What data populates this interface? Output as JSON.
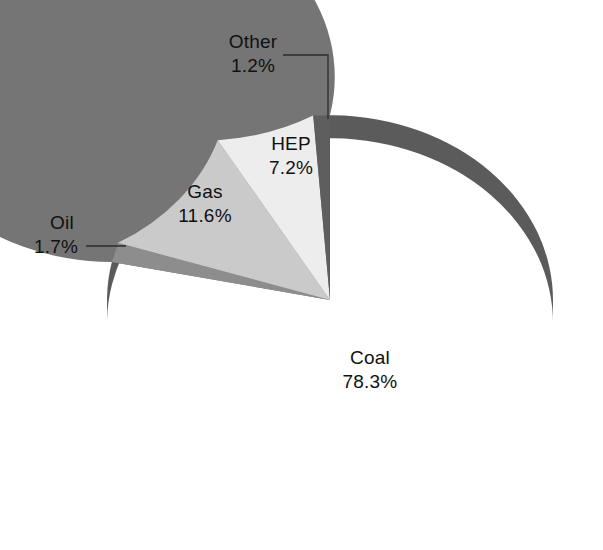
{
  "chart_data": {
    "type": "pie",
    "title": "",
    "subtitle": "",
    "xlabel": "",
    "ylabel": "",
    "legend_position": "none",
    "grid": false,
    "three_d": true,
    "start_angle_deg": -90,
    "direction": "counterclockwise",
    "categories": [
      "Coal",
      "Oil",
      "Gas",
      "HEP",
      "Other"
    ],
    "values": [
      78.3,
      1.7,
      11.6,
      7.2,
      1.2
    ],
    "unit": "%",
    "slices": [
      {
        "name": "Coal",
        "label": "Coal",
        "value": 78.3,
        "value_text": "78.3%",
        "color": "#757575",
        "side_color": "#5b5b5b",
        "label_x": 370,
        "label_y": 364,
        "leader": false
      },
      {
        "name": "Oil",
        "label": "Oil",
        "value": 1.7,
        "value_text": "1.7%",
        "color": "#8d8d8d",
        "side_color": "#6e6e6e",
        "label_x": 62,
        "label_y": 229,
        "leader": true
      },
      {
        "name": "Gas",
        "label": "Gas",
        "value": 11.6,
        "value_text": "11.6%",
        "color": "#cacaca",
        "side_color": "#a5a5a5",
        "label_x": 205,
        "label_y": 198,
        "leader": false
      },
      {
        "name": "HEP",
        "label": "HEP",
        "value": 7.2,
        "value_text": "7.2%",
        "color": "#ededed",
        "side_color": "#c2c2c2",
        "label_x": 291,
        "label_y": 150,
        "leader": false
      },
      {
        "name": "Other",
        "label": "Other",
        "value": 1.2,
        "value_text": "1.2%",
        "color": "#5e5e5e",
        "side_color": "#4a4a4a",
        "label_x": 253,
        "label_y": 48,
        "leader": true
      }
    ],
    "colors": {
      "coal": "#757575",
      "oil": "#8d8d8d",
      "gas": "#cacaca",
      "hep": "#ededed",
      "other": "#5e5e5e",
      "background": "#ffffff",
      "text": "#111111",
      "leader": "#2b2b2b"
    },
    "geometry": {
      "center_x": 330,
      "center_y": 300,
      "radius_x": 223,
      "radius_y": 185,
      "depth": 23
    }
  },
  "labels": {
    "coal_name": "Coal",
    "coal_pct": "78.3%",
    "oil_name": "Oil",
    "oil_pct": "1.7%",
    "gas_name": "Gas",
    "gas_pct": "11.6%",
    "hep_name": "HEP",
    "hep_pct": "7.2%",
    "other_name": "Other",
    "other_pct": "1.2%"
  }
}
